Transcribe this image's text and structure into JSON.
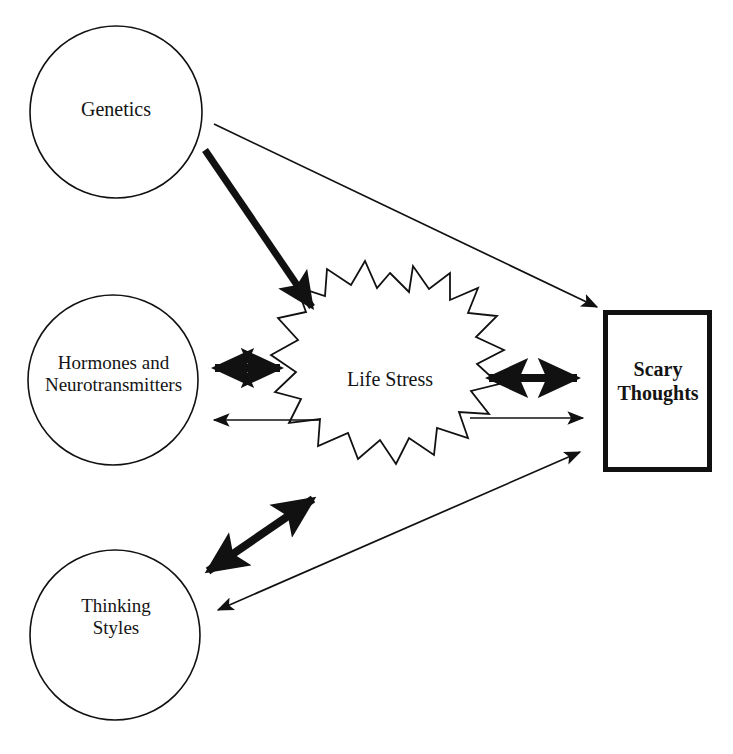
{
  "diagram": {
    "background_color": "#ffffff",
    "stroke_color": "#111111",
    "nodes": [
      {
        "id": "genetics",
        "label": "Genetics",
        "shape": "circle",
        "cx": 116,
        "cy": 112,
        "r": 86,
        "stroke_width": 1.6
      },
      {
        "id": "hormones",
        "label": "Hormones and\nNeurotransmitters",
        "shape": "circle",
        "cx": 113,
        "cy": 380,
        "r": 85,
        "stroke_width": 1.6
      },
      {
        "id": "thinking_styles",
        "label": "Thinking\nStyles",
        "shape": "circle",
        "cx": 115,
        "cy": 635,
        "r": 85,
        "stroke_width": 1.6
      },
      {
        "id": "life_stress",
        "label": "Life Stress",
        "shape": "starburst",
        "cx": 390,
        "cy": 383,
        "outer_r": 110,
        "inner_r": 72,
        "points": 16,
        "stroke_width": 1.8
      },
      {
        "id": "scary_thoughts",
        "label": "Scary\nThoughts",
        "shape": "rectangle",
        "x": 603,
        "y": 310,
        "width": 109,
        "height": 162,
        "stroke_width": 5,
        "bold": true
      }
    ],
    "edges": [
      {
        "id": "genetics-to-scary",
        "from": "genetics",
        "to": "scary_thoughts",
        "weight": "thin",
        "arrowheads": "end",
        "x1": 214,
        "y1": 124,
        "x2": 597,
        "y2": 307
      },
      {
        "id": "genetics-to-lifestress",
        "from": "genetics",
        "to": "life_stress",
        "weight": "thick",
        "arrowheads": "end",
        "x1": 205,
        "y1": 150,
        "x2": 312,
        "y2": 307
      },
      {
        "id": "hormones-lifestress",
        "from": "hormones",
        "to": "life_stress",
        "weight": "thick",
        "arrowheads": "both",
        "x1": 210,
        "y1": 368,
        "x2": 285,
        "y2": 368
      },
      {
        "id": "lifestress-to-hormones",
        "from": "life_stress",
        "to": "hormones",
        "weight": "thin",
        "arrowheads": "end",
        "x1": 320,
        "y1": 420,
        "x2": 212,
        "y2": 420
      },
      {
        "id": "lifestress-scary",
        "from": "life_stress",
        "to": "scary_thoughts",
        "weight": "thick",
        "arrowheads": "both",
        "x1": 484,
        "y1": 378,
        "x2": 582,
        "y2": 378
      },
      {
        "id": "lifestress-to-scary-thin",
        "from": "life_stress",
        "to": "scary_thoughts",
        "weight": "thin",
        "arrowheads": "end",
        "x1": 470,
        "y1": 418,
        "x2": 585,
        "y2": 418
      },
      {
        "id": "lifestress-thinking",
        "from": "life_stress",
        "to": "thinking_styles",
        "weight": "thick",
        "arrowheads": "both",
        "x1": 318,
        "y1": 495,
        "x2": 202,
        "y2": 576
      },
      {
        "id": "thinking-scary",
        "from": "thinking_styles",
        "to": "scary_thoughts",
        "weight": "thin",
        "arrowheads": "both",
        "x1": 215,
        "y1": 611,
        "x2": 583,
        "y2": 450
      }
    ]
  }
}
